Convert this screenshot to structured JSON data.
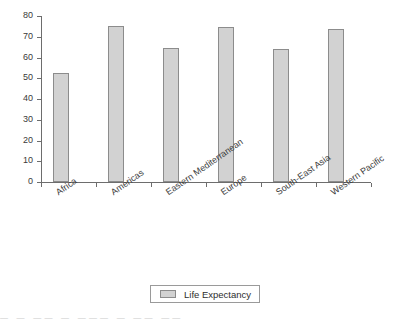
{
  "chart_data": {
    "type": "bar",
    "title": "",
    "xlabel": "",
    "ylabel": "",
    "categories": [
      "Africa",
      "Americas",
      "Eastern Mediterranean",
      "Europe",
      "South-East Asia",
      "Western Pacific"
    ],
    "values": [
      52.5,
      75.3,
      64.7,
      74.5,
      64.1,
      73.6
    ],
    "series": [
      {
        "name": "Life Expectancy",
        "values": [
          52.5,
          75.3,
          64.7,
          74.5,
          64.1,
          73.6
        ]
      }
    ],
    "ylim": [
      0,
      80
    ],
    "ytick_labels": [
      "0",
      "10",
      "20",
      "30",
      "40",
      "50",
      "60",
      "70",
      "80"
    ],
    "ytick_values": [
      0,
      10,
      20,
      30,
      40,
      50,
      60,
      70,
      80
    ],
    "grid": false,
    "legend_position": "bottom",
    "legend_entries": [
      "Life Expectancy"
    ],
    "bar_color": "#d2d2d2",
    "bar_border_color": "#8c8c8c",
    "axis_color": "#6d6d6d"
  },
  "legend": {
    "label": "Life Expectancy"
  },
  "caption": {
    "text": "— —  ——   —   ——— — ——  ——"
  }
}
